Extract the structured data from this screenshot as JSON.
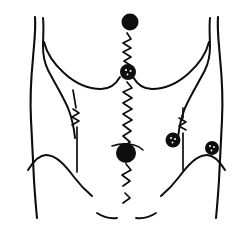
{
  "figure": {
    "title": "Abdominal surgical site diagram",
    "background_color": "#ffffff",
    "ink_color": "#0d0d0d",
    "width": 252,
    "height": 235
  },
  "anatomy": {
    "outlines": [
      {
        "name": "left-torso-flank",
        "label": "Left lateral torso contour"
      },
      {
        "name": "left-inner-flank",
        "label": "Left inner flank contour"
      },
      {
        "name": "left-costal-margin",
        "label": "Left costal margin curve"
      },
      {
        "name": "right-torso-flank",
        "label": "Right lateral torso contour"
      },
      {
        "name": "right-inner-flank",
        "label": "Right inner flank contour"
      },
      {
        "name": "right-costal-margin",
        "label": "Right costal margin curve"
      },
      {
        "name": "left-iliac-crest",
        "label": "Left iliac crest curve"
      },
      {
        "name": "right-iliac-crest",
        "label": "Right iliac crest curve"
      },
      {
        "name": "left-inguinal-crease",
        "label": "Left inguinal crease"
      },
      {
        "name": "right-inguinal-crease",
        "label": "Right inguinal crease"
      }
    ]
  },
  "markings": {
    "midline_incision": {
      "name": "midline-incision-scar",
      "label": "Midline vertical incision scar",
      "style": "zigzag-suture",
      "x": 127,
      "y_start": 32,
      "y_end": 205
    },
    "lateral_scars": [
      {
        "name": "left-lateral-drain-line",
        "label": "Left lateral vertical drain line",
        "x": 76,
        "y_start": 90,
        "y_end": 172,
        "zigzag_center_y": 117
      },
      {
        "name": "right-lateral-drain-line",
        "label": "Right lateral vertical drain line",
        "x": 182,
        "y_start": 108,
        "y_end": 170,
        "zigzag_center_y": 124
      }
    ],
    "ports": [
      {
        "name": "epigastric-port-site",
        "label": "Epigastric port site",
        "cx": 130,
        "cy": 22,
        "r": 8.5,
        "notched": false
      },
      {
        "name": "supraumbilical-port-site",
        "label": "Supraumbilical port site",
        "cx": 128,
        "cy": 72,
        "r": 8,
        "notched": true
      },
      {
        "name": "umbilical-port-site",
        "label": "Umbilical port site",
        "cx": 126,
        "cy": 153,
        "r": 10,
        "notched": false
      },
      {
        "name": "right-lower-quadrant-port-site",
        "label": "Right lower quadrant port site",
        "cx": 173,
        "cy": 140,
        "r": 7.5,
        "notched": true
      },
      {
        "name": "right-flank-port-site",
        "label": "Right flank port site",
        "cx": 212,
        "cy": 148,
        "r": 7,
        "notched": true
      }
    ]
  },
  "legend": {
    "dot_meaning": "port / stoma site",
    "zigzag_meaning": "sutured incision"
  }
}
